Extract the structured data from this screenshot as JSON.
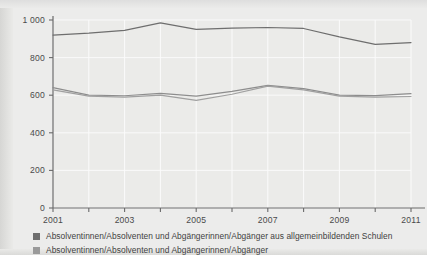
{
  "figure": {
    "background_color": "#ececeb",
    "plot_background_color": "#ebebe9"
  },
  "legend": {
    "position": "below-plot",
    "items": [
      {
        "label": "Absolventinnen/Absolventen und Abgängerinnen/Abgänger aus allgemeinbildenden Schulen",
        "color": "#6e6e6e",
        "swatch": "square-marker"
      },
      {
        "label": "Absolventinnen/Absolventen und Abgängerinnen/Abgänger",
        "color": "#9a9a9a",
        "swatch": "square-marker"
      }
    ]
  },
  "chart_data": {
    "type": "line",
    "title": "",
    "subtitle": "",
    "xlabel": "",
    "ylabel": "",
    "grid": true,
    "legend_position": "below",
    "xlim": [
      2001,
      2011
    ],
    "ylim": [
      0,
      1000
    ],
    "x": [
      2001,
      2002,
      2003,
      2004,
      2005,
      2006,
      2007,
      2008,
      2009,
      2010,
      2011
    ],
    "xtick_labels": [
      "2001",
      "2003",
      "2005",
      "2007",
      "2009",
      "2011"
    ],
    "xtick_values": [
      2001,
      2003,
      2005,
      2007,
      2009,
      2011
    ],
    "ytick_labels": [
      "0",
      "200",
      "400",
      "600",
      "800",
      "1 000"
    ],
    "ytick_values": [
      0,
      200,
      400,
      600,
      800,
      1000
    ],
    "series": [
      {
        "name": "Absolventinnen/Absolventen und Abgängerinnen/Abgänger aus allgemeinbildenden Schulen",
        "color": "#6e6e6e",
        "values": [
          920,
          930,
          945,
          985,
          950,
          957,
          960,
          955,
          910,
          870,
          880
        ]
      },
      {
        "name": "Absolventinnen/Absolventen und Abgängerinnen/Abgänger",
        "color": "#8d8d8d",
        "values": [
          640,
          600,
          597,
          610,
          595,
          620,
          652,
          635,
          600,
          598,
          608
        ]
      },
      {
        "name": "Absolventinnen/Absolventen",
        "color": "#a0a0a0",
        "values": [
          628,
          595,
          590,
          600,
          572,
          605,
          648,
          628,
          595,
          590,
          593
        ]
      }
    ]
  }
}
